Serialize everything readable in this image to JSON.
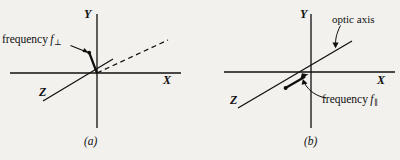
{
  "figure": {
    "background_color": "#f2f1ee",
    "ink_color": "#100f0e",
    "panels": [
      {
        "id": "a",
        "caption": "(a)",
        "axes": {
          "y_label": "Y",
          "x_label": "X",
          "z_label": "Z"
        },
        "annotations": {
          "frequency_label_text": "frequency",
          "frequency_symbol": "f",
          "frequency_subscript": "⊥"
        },
        "elements": [
          "y-axis-line",
          "x-axis-line",
          "z-axis-line",
          "dashed-ray-line",
          "polarization-tick",
          "frequency-leader-arrow"
        ]
      },
      {
        "id": "b",
        "caption": "(b)",
        "axes": {
          "y_label": "Y",
          "x_label": "X",
          "z_label": "Z"
        },
        "annotations": {
          "optic_axis_label": "optic axis",
          "frequency_label_text": "frequency",
          "frequency_symbol": "f",
          "frequency_subscript": "∥"
        },
        "elements": [
          "y-axis-line",
          "x-axis-line",
          "z-axis-line",
          "optic-axis-line",
          "propagation-arrow",
          "optic-axis-leader-arrow",
          "frequency-leader-arrow"
        ]
      }
    ]
  }
}
